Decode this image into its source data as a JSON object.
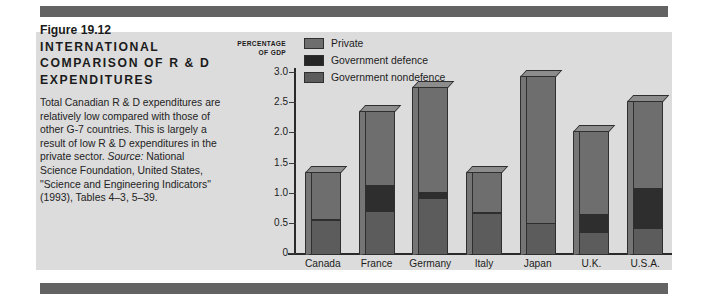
{
  "figure": {
    "number_label": "Figure 19.12",
    "headline": "INTERNATIONAL COMPARISON OF R & D EXPENDITURES",
    "body": "Total Canadian R & D expenditures are relatively low compared with those of other G-7 countries. This is largely a result of low R & D expenditures in the private sector. ",
    "source_word": "Source:",
    "source_text": " National Science Foundation, United States, \"Science and Engineering Indicators\" (1993), Tables 4–3, 5–39."
  },
  "chart_data": {
    "type": "bar",
    "subtype": "stacked",
    "title": "Figure 19.12 INTERNATIONAL COMPARISON OF R & D EXPENDITURES",
    "xlabel": "",
    "ylabel": "PERCENTAGE OF GDP",
    "ylabel_line1": "PERCENTAGE",
    "ylabel_line2": "OF GDP",
    "ylim": [
      0,
      3.0
    ],
    "yticks": [
      "0",
      "0.5",
      "1.0",
      "1.5",
      "2.0",
      "2.5",
      "3.0"
    ],
    "ytick_values": [
      0,
      0.5,
      1.0,
      1.5,
      2.0,
      2.5,
      3.0
    ],
    "grid": false,
    "legend_position": "top-left-inside",
    "categories": [
      "Canada",
      "France",
      "Germany",
      "Italy",
      "Japan",
      "U.K.",
      "U.S.A."
    ],
    "series": [
      {
        "name": "Government nondefence",
        "color": "#5c5c5c",
        "values": [
          0.55,
          0.7,
          0.92,
          0.67,
          0.5,
          0.35,
          0.42
        ]
      },
      {
        "name": "Government defence",
        "color": "#2e2e2e",
        "values": [
          0.03,
          0.45,
          0.11,
          0.03,
          0.02,
          0.32,
          0.68
        ]
      },
      {
        "name": "Private",
        "color": "#6e6e6e",
        "values": [
          0.8,
          1.23,
          1.75,
          0.67,
          2.45,
          1.38,
          1.45
        ]
      }
    ],
    "totals": [
      1.38,
      2.38,
      2.78,
      1.37,
      2.97,
      2.05,
      2.55
    ]
  },
  "legend": {
    "items": [
      {
        "label": "Private",
        "swatch": "private"
      },
      {
        "label": "Government defence",
        "swatch": "defence"
      },
      {
        "label": "Government nondefence",
        "swatch": "nondefence"
      }
    ]
  },
  "colors": {
    "panel_background": "#dcdcdc",
    "rule": "#636363",
    "private": "#6e6e6e",
    "defence": "#2e2e2e",
    "nondefence": "#5c5c5c",
    "axis": "#2a2a2a"
  }
}
